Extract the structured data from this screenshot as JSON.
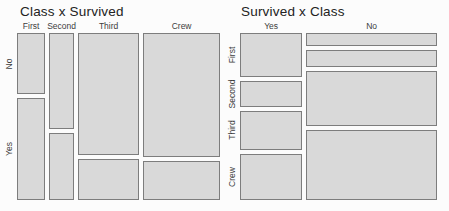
{
  "window": {
    "background": "#fcfcfc"
  },
  "colors": {
    "cell_fill": "#d9d9d9",
    "cell_border": "#7d7d7d",
    "title_color": "#222222",
    "label_color": "#3d3d3d"
  },
  "chart_data": [
    {
      "type": "mosaic",
      "title": "Class x Survived",
      "col_labels": [
        "First",
        "Second",
        "Third",
        "Crew"
      ],
      "row_labels": [
        "No",
        "Yes"
      ],
      "counts": [
        [
          122,
          203
        ],
        [
          167,
          118
        ],
        [
          528,
          178
        ],
        [
          673,
          212
        ]
      ],
      "col_totals": [
        325,
        285,
        706,
        885
      ],
      "grand_total": 2201,
      "legend": "none",
      "grid": false,
      "area": {
        "left": 17,
        "top": 33,
        "width": 203,
        "height": 167
      },
      "title_left": 20
    },
    {
      "type": "mosaic",
      "title": "Survived x Class",
      "col_labels": [
        "Yes",
        "No"
      ],
      "row_labels": [
        "First",
        "Second",
        "Third",
        "Crew"
      ],
      "counts": [
        [
          203,
          118,
          178,
          212
        ],
        [
          122,
          167,
          528,
          673
        ]
      ],
      "col_totals": [
        711,
        1490
      ],
      "grand_total": 2201,
      "legend": "none",
      "grid": false,
      "area": {
        "left": 240,
        "top": 33,
        "width": 197,
        "height": 167
      },
      "title_left": 241
    }
  ]
}
